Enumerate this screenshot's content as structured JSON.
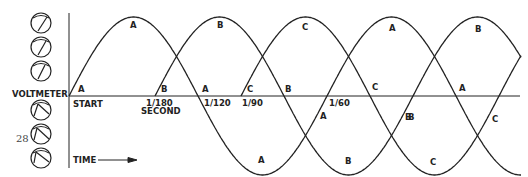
{
  "page_number": "28",
  "left_labels": {
    "voltmeter": "VOLTMETER"
  },
  "axis": {
    "start_label": "START",
    "time_label": "TIME",
    "ticks": [
      {
        "label": "1/180",
        "sub": "SECOND"
      },
      {
        "label": "1/120"
      },
      {
        "label": "1/90"
      },
      {
        "label": "1/60"
      }
    ]
  },
  "phases": [
    "A",
    "B",
    "C"
  ],
  "colors": {
    "ink": "#222222",
    "paper": "#ffffff"
  },
  "dials": [
    {
      "position": "upper",
      "needle": "right"
    },
    {
      "position": "upper",
      "needle": "right"
    },
    {
      "position": "upper",
      "needle": "right"
    },
    {
      "position": "lower",
      "needle": "left"
    },
    {
      "position": "lower",
      "needle": "left"
    },
    {
      "position": "lower",
      "needle": "left"
    }
  ]
}
